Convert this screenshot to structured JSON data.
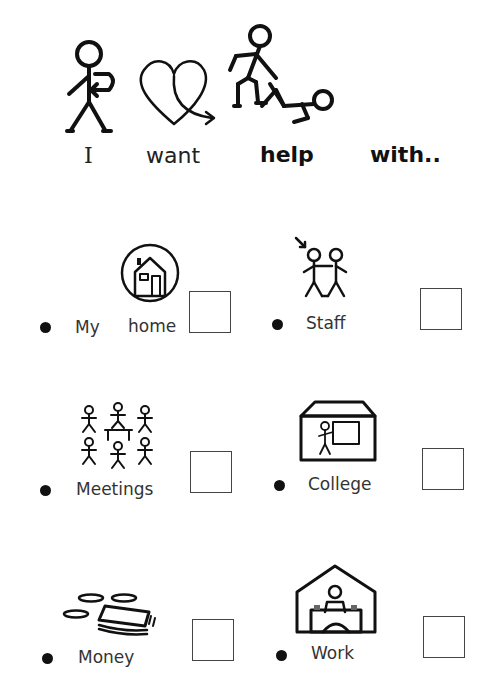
{
  "header": {
    "words": [
      "I",
      "want",
      "help",
      "with.."
    ],
    "icons": [
      "person-self-icon",
      "heart-want-icon",
      "help-people-icon"
    ]
  },
  "items": [
    {
      "id": "my-home",
      "label_parts": [
        "My",
        "home"
      ],
      "icon": "house-icon",
      "checked": false
    },
    {
      "id": "staff",
      "label": "Staff",
      "icon": "staff-people-icon",
      "checked": false
    },
    {
      "id": "meetings",
      "label": "Meetings",
      "icon": "meeting-group-icon",
      "checked": false
    },
    {
      "id": "college",
      "label": "College",
      "icon": "college-building-icon",
      "checked": false
    },
    {
      "id": "money",
      "label": "Money",
      "icon": "money-icon",
      "checked": false
    },
    {
      "id": "work",
      "label": "Work",
      "icon": "workplace-icon",
      "checked": false
    }
  ]
}
